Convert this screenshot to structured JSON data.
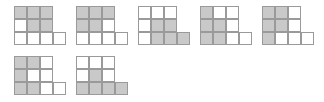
{
  "sheet": {
    "background_color": "#ffffff",
    "cell_size_px": 13,
    "grid_line_color": "#9a9a9a",
    "shaded_cell_color": "#c9c9c9",
    "empty_cell_color": "#ffffff",
    "figure_count": 7,
    "rows_of_figures": 2
  },
  "figure_shape": {
    "description": "3x3 grid with one additional square attached to the right end of the bottom row",
    "grid_rows": 3,
    "grid_cols": 3,
    "extra_cell": {
      "row": 2,
      "col": 3
    },
    "total_cells": 10
  },
  "figures": [
    {
      "id": "figure-1",
      "label": "1",
      "shaded_count": 4,
      "cells": [
        {
          "row": 0,
          "col": 0,
          "shaded": true
        },
        {
          "row": 0,
          "col": 1,
          "shaded": true
        },
        {
          "row": 0,
          "col": 2,
          "shaded": true
        },
        {
          "row": 1,
          "col": 0,
          "shaded": false
        },
        {
          "row": 1,
          "col": 1,
          "shaded": true
        },
        {
          "row": 1,
          "col": 2,
          "shaded": true
        },
        {
          "row": 2,
          "col": 0,
          "shaded": false
        },
        {
          "row": 2,
          "col": 1,
          "shaded": false
        },
        {
          "row": 2,
          "col": 2,
          "shaded": false
        },
        {
          "row": 2,
          "col": 3,
          "shaded": false
        }
      ]
    },
    {
      "id": "figure-2",
      "label": "2",
      "shaded_count": 4,
      "cells": [
        {
          "row": 0,
          "col": 0,
          "shaded": true
        },
        {
          "row": 0,
          "col": 1,
          "shaded": true
        },
        {
          "row": 0,
          "col": 2,
          "shaded": true
        },
        {
          "row": 1,
          "col": 0,
          "shaded": true
        },
        {
          "row": 1,
          "col": 1,
          "shaded": true
        },
        {
          "row": 1,
          "col": 2,
          "shaded": false
        },
        {
          "row": 2,
          "col": 0,
          "shaded": false
        },
        {
          "row": 2,
          "col": 1,
          "shaded": false
        },
        {
          "row": 2,
          "col": 2,
          "shaded": false
        },
        {
          "row": 2,
          "col": 3,
          "shaded": false
        }
      ]
    },
    {
      "id": "figure-3",
      "label": "3",
      "shaded_count": 4,
      "cells": [
        {
          "row": 0,
          "col": 0,
          "shaded": false
        },
        {
          "row": 0,
          "col": 1,
          "shaded": false
        },
        {
          "row": 0,
          "col": 2,
          "shaded": false
        },
        {
          "row": 1,
          "col": 0,
          "shaded": false
        },
        {
          "row": 1,
          "col": 1,
          "shaded": true
        },
        {
          "row": 1,
          "col": 2,
          "shaded": true
        },
        {
          "row": 2,
          "col": 0,
          "shaded": false
        },
        {
          "row": 2,
          "col": 1,
          "shaded": true
        },
        {
          "row": 2,
          "col": 2,
          "shaded": true
        },
        {
          "row": 2,
          "col": 3,
          "shaded": true
        }
      ]
    },
    {
      "id": "figure-4",
      "label": "4",
      "shaded_count": 4,
      "cells": [
        {
          "row": 0,
          "col": 0,
          "shaded": true
        },
        {
          "row": 0,
          "col": 1,
          "shaded": false
        },
        {
          "row": 0,
          "col": 2,
          "shaded": false
        },
        {
          "row": 1,
          "col": 0,
          "shaded": true
        },
        {
          "row": 1,
          "col": 1,
          "shaded": true
        },
        {
          "row": 1,
          "col": 2,
          "shaded": false
        },
        {
          "row": 2,
          "col": 0,
          "shaded": true
        },
        {
          "row": 2,
          "col": 1,
          "shaded": true
        },
        {
          "row": 2,
          "col": 2,
          "shaded": false
        },
        {
          "row": 2,
          "col": 3,
          "shaded": false
        }
      ]
    },
    {
      "id": "figure-5",
      "label": "5",
      "shaded_count": 5,
      "cells": [
        {
          "row": 0,
          "col": 0,
          "shaded": true
        },
        {
          "row": 0,
          "col": 1,
          "shaded": true
        },
        {
          "row": 0,
          "col": 2,
          "shaded": false
        },
        {
          "row": 1,
          "col": 0,
          "shaded": true
        },
        {
          "row": 1,
          "col": 1,
          "shaded": true
        },
        {
          "row": 1,
          "col": 2,
          "shaded": false
        },
        {
          "row": 2,
          "col": 0,
          "shaded": true
        },
        {
          "row": 2,
          "col": 1,
          "shaded": false
        },
        {
          "row": 2,
          "col": 2,
          "shaded": false
        },
        {
          "row": 2,
          "col": 3,
          "shaded": false
        }
      ]
    },
    {
      "id": "figure-6",
      "label": "6",
      "shaded_count": 6,
      "cells": [
        {
          "row": 0,
          "col": 0,
          "shaded": true
        },
        {
          "row": 0,
          "col": 1,
          "shaded": true
        },
        {
          "row": 0,
          "col": 2,
          "shaded": false
        },
        {
          "row": 1,
          "col": 0,
          "shaded": true
        },
        {
          "row": 1,
          "col": 1,
          "shaded": false
        },
        {
          "row": 1,
          "col": 2,
          "shaded": false
        },
        {
          "row": 2,
          "col": 0,
          "shaded": true
        },
        {
          "row": 2,
          "col": 1,
          "shaded": true
        },
        {
          "row": 2,
          "col": 2,
          "shaded": false
        },
        {
          "row": 2,
          "col": 3,
          "shaded": false
        }
      ]
    },
    {
      "id": "figure-7",
      "label": "7",
      "shaded_count": 5,
      "cells": [
        {
          "row": 0,
          "col": 0,
          "shaded": false
        },
        {
          "row": 0,
          "col": 1,
          "shaded": false
        },
        {
          "row": 0,
          "col": 2,
          "shaded": false
        },
        {
          "row": 1,
          "col": 0,
          "shaded": false
        },
        {
          "row": 1,
          "col": 1,
          "shaded": true
        },
        {
          "row": 1,
          "col": 2,
          "shaded": false
        },
        {
          "row": 2,
          "col": 0,
          "shaded": true
        },
        {
          "row": 2,
          "col": 1,
          "shaded": true
        },
        {
          "row": 2,
          "col": 2,
          "shaded": true
        },
        {
          "row": 2,
          "col": 3,
          "shaded": true
        }
      ]
    }
  ],
  "layout": {
    "top_row_figure_ids": [
      "figure-1",
      "figure-2",
      "figure-3",
      "figure-4",
      "figure-5"
    ],
    "bottom_row_figure_ids": [
      "figure-6",
      "figure-7"
    ],
    "figure_pitch_px": 62,
    "top_row_y_px": 6,
    "bottom_row_y_px": 56
  }
}
